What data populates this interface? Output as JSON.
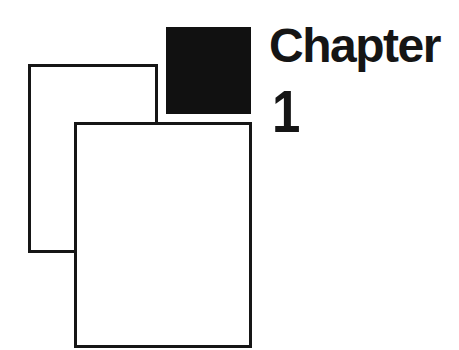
{
  "heading": {
    "label": "Chapter",
    "number": "1"
  },
  "graphic": {
    "pages": [
      "back-page",
      "front-page"
    ],
    "accent_color": "#111111"
  }
}
